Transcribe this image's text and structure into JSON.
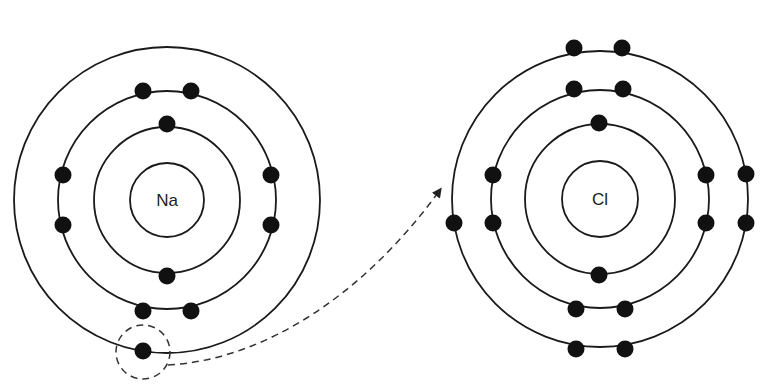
{
  "diagram": {
    "type": "bohr-model-ionic-bond",
    "atoms": [
      {
        "symbol": "Na",
        "center": [
          167,
          200
        ],
        "nucleus_radius": 37,
        "shells": [
          {
            "radius": 73,
            "electrons": [
              [
                167,
                124
              ],
              [
                167,
                276
              ]
            ]
          },
          {
            "radius": 109,
            "electrons": [
              [
                143,
                91
              ],
              [
                191,
                91
              ],
              [
                63,
                175
              ],
              [
                63,
                225
              ],
              [
                271,
                175
              ],
              [
                271,
                225
              ],
              [
                143,
                311
              ],
              [
                191,
                311
              ]
            ]
          },
          {
            "radius": 153,
            "electrons": [
              [
                143,
                351
              ]
            ]
          }
        ]
      },
      {
        "symbol": "Cl",
        "center": [
          600,
          199
        ],
        "nucleus_radius": 38,
        "shells": [
          {
            "radius": 75,
            "electrons": [
              [
                599,
                123
              ],
              [
                599,
                275
              ]
            ]
          },
          {
            "radius": 109,
            "electrons": [
              [
                574,
                89
              ],
              [
                623,
                89
              ],
              [
                493,
                175
              ],
              [
                493,
                223
              ],
              [
                706,
                175
              ],
              [
                706,
                223
              ],
              [
                576,
                309
              ],
              [
                625,
                309
              ]
            ]
          },
          {
            "radius": 148,
            "electrons": [
              [
                574,
                48
              ],
              [
                622,
                48
              ],
              [
                746,
                174
              ],
              [
                746,
                223
              ],
              [
                454,
                223
              ],
              [
                576,
                349
              ],
              [
                625,
                349
              ]
            ]
          }
        ]
      }
    ],
    "transfer": {
      "highlight_circle": {
        "center": [
          143,
          352
        ],
        "radius": 27
      },
      "arrow_path": "M 168 365 C 260 360, 360 300, 440 190",
      "arrow_head": [
        442,
        188
      ]
    }
  },
  "labels": {
    "na": "Na",
    "cl": "Cl"
  }
}
